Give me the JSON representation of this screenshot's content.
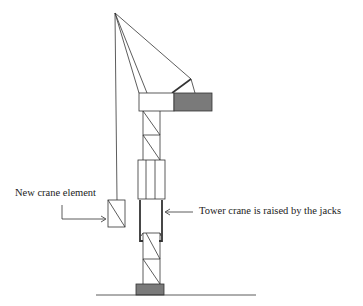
{
  "diagram": {
    "labels": {
      "new_crane_element": "New crane element",
      "tower_raised": "Tower crane is raised by the jacks"
    },
    "colors": {
      "line": "#333333",
      "counterweight_fill": "#7a7a7a",
      "base_fill": "#7a7a7a",
      "background": "#ffffff"
    },
    "components": [
      "jib-apex",
      "hoist-cable",
      "tie-cables",
      "jib",
      "counterweight",
      "upper-tower-lattice",
      "climbing-frame",
      "hydraulic-jacks",
      "lower-tower-lattice",
      "foundation-base",
      "ground-line",
      "new-crane-element"
    ]
  }
}
